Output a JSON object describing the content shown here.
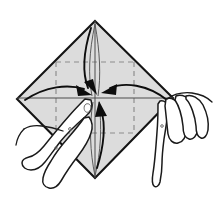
{
  "figure": {
    "title": "Origami fold step diagram",
    "background_color": "#ffffff",
    "paper_fill": "#dcdcdc",
    "paper_outline_color": "#141414",
    "crease_color": "#8c8c8c",
    "arrow_color": "#0d0d0d",
    "hand_outline_color": "#1a1a1a",
    "hand_fill": "#ffffff"
  },
  "paper": {
    "shape": "diamond",
    "vertices": {
      "top": [
        95,
        21
      ],
      "right": [
        173,
        98
      ],
      "bottom": [
        95,
        178
      ],
      "left": [
        17,
        99
      ]
    },
    "center": [
      95,
      97
    ]
  },
  "creases": {
    "inner_square": {
      "top_left": [
        56,
        62
      ],
      "top_right": [
        134,
        62
      ],
      "bottom_right": [
        134,
        133
      ],
      "bottom_left": [
        56,
        133
      ]
    },
    "vertical_axis_x": 95,
    "horizontal_axis_y": 97
  },
  "arrows": [
    {
      "name": "arrow-top-down",
      "direction": "down",
      "from": [
        95,
        28
      ],
      "to": [
        95,
        92
      ],
      "meaning": "fold top corner to center"
    },
    {
      "name": "arrow-left-right",
      "direction": "right",
      "from": [
        26,
        100
      ],
      "to": [
        90,
        95
      ],
      "meaning": "fold left corner to center"
    },
    {
      "name": "arrow-right-left",
      "direction": "left",
      "from": [
        166,
        100
      ],
      "to": [
        101,
        95
      ],
      "meaning": "fold right corner to center"
    },
    {
      "name": "arrow-bottom-up",
      "direction": "up",
      "from": [
        98,
        168
      ],
      "to": [
        99,
        103
      ],
      "meaning": "fold bottom corner to center"
    }
  ],
  "hands": [
    {
      "name": "left-hand",
      "side": "left",
      "gesture": "index finger pressing the paper center from lower left"
    },
    {
      "name": "right-hand",
      "side": "right",
      "gesture": "fingers pinching the right corner of the paper"
    }
  ]
}
